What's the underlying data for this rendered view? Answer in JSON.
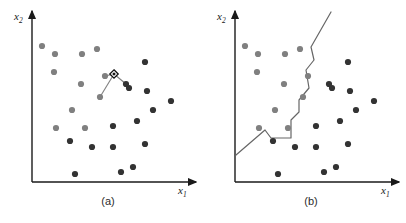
{
  "figure": {
    "width": 406,
    "height": 223,
    "background": "#ffffff",
    "colors": {
      "axis": "#1a1a1a",
      "class_a_point": "#808080",
      "class_b_point": "#333333",
      "boundary_line": "#666666",
      "connector_line": "#808080",
      "query_marker_stroke": "#111111",
      "caption_text": "#2b2b2b"
    }
  },
  "panels": [
    {
      "id": "panel-a",
      "caption": "(a)",
      "caption_pos": {
        "x": 108,
        "y": 205
      },
      "axes": {
        "origin": {
          "x": 32,
          "y": 182
        },
        "x_axis_end": {
          "x": 196,
          "y": 182
        },
        "y_axis_end": {
          "x": 32,
          "y": 11
        },
        "x_label": {
          "base": "x",
          "sub": "1",
          "x": 178,
          "y": 194
        },
        "y_label": {
          "base": "x",
          "sub": "2",
          "x": 14,
          "y": 20
        }
      },
      "points": [
        {
          "x": 42,
          "y": 46,
          "cls": "a"
        },
        {
          "x": 55,
          "y": 54,
          "cls": "a"
        },
        {
          "x": 82,
          "y": 54,
          "cls": "a"
        },
        {
          "x": 97,
          "y": 49,
          "cls": "a"
        },
        {
          "x": 54,
          "y": 72,
          "cls": "a"
        },
        {
          "x": 81,
          "y": 84,
          "cls": "a"
        },
        {
          "x": 72,
          "y": 110,
          "cls": "a"
        },
        {
          "x": 56,
          "y": 128,
          "cls": "a"
        },
        {
          "x": 85,
          "y": 128,
          "cls": "a"
        },
        {
          "x": 105,
          "y": 76,
          "cls": "a"
        },
        {
          "x": 100,
          "y": 97,
          "cls": "a"
        },
        {
          "x": 145,
          "y": 62,
          "cls": "b"
        },
        {
          "x": 129,
          "y": 88,
          "cls": "b"
        },
        {
          "x": 147,
          "y": 91,
          "cls": "b"
        },
        {
          "x": 126,
          "y": 84,
          "cls": "b"
        },
        {
          "x": 171,
          "y": 101,
          "cls": "b"
        },
        {
          "x": 153,
          "y": 110,
          "cls": "b"
        },
        {
          "x": 137,
          "y": 121,
          "cls": "b"
        },
        {
          "x": 113,
          "y": 126,
          "cls": "b"
        },
        {
          "x": 70,
          "y": 141,
          "cls": "b"
        },
        {
          "x": 92,
          "y": 147,
          "cls": "b"
        },
        {
          "x": 113,
          "y": 147,
          "cls": "b"
        },
        {
          "x": 145,
          "y": 144,
          "cls": "b"
        },
        {
          "x": 75,
          "y": 174,
          "cls": "b"
        },
        {
          "x": 121,
          "y": 172,
          "cls": "b"
        },
        {
          "x": 133,
          "y": 167,
          "cls": "b"
        }
      ],
      "query_marker": {
        "x": 114,
        "y": 74,
        "shape": "diamond"
      },
      "connectors": [
        {
          "x1": 114,
          "y1": 74,
          "x2": 105,
          "y2": 76
        },
        {
          "x1": 114,
          "y1": 74,
          "x2": 126,
          "y2": 84
        },
        {
          "x1": 114,
          "y1": 74,
          "x2": 100,
          "y2": 97
        }
      ],
      "boundary": null
    },
    {
      "id": "panel-b",
      "caption": "(b)",
      "caption_pos": {
        "x": 311,
        "y": 205
      },
      "axes": {
        "origin": {
          "x": 235,
          "y": 182
        },
        "x_axis_end": {
          "x": 399,
          "y": 182
        },
        "y_axis_end": {
          "x": 235,
          "y": 11
        },
        "x_label": {
          "base": "x",
          "sub": "1",
          "x": 381,
          "y": 194
        },
        "y_label": {
          "base": "x",
          "sub": "2",
          "x": 217,
          "y": 20
        }
      },
      "points": [
        {
          "x": 245,
          "y": 46,
          "cls": "a"
        },
        {
          "x": 258,
          "y": 54,
          "cls": "a"
        },
        {
          "x": 285,
          "y": 54,
          "cls": "a"
        },
        {
          "x": 300,
          "y": 49,
          "cls": "a"
        },
        {
          "x": 257,
          "y": 72,
          "cls": "a"
        },
        {
          "x": 284,
          "y": 84,
          "cls": "a"
        },
        {
          "x": 275,
          "y": 110,
          "cls": "a"
        },
        {
          "x": 259,
          "y": 128,
          "cls": "a"
        },
        {
          "x": 288,
          "y": 128,
          "cls": "a"
        },
        {
          "x": 308,
          "y": 76,
          "cls": "a"
        },
        {
          "x": 303,
          "y": 97,
          "cls": "a"
        },
        {
          "x": 348,
          "y": 62,
          "cls": "b"
        },
        {
          "x": 332,
          "y": 88,
          "cls": "b"
        },
        {
          "x": 350,
          "y": 91,
          "cls": "b"
        },
        {
          "x": 329,
          "y": 84,
          "cls": "b"
        },
        {
          "x": 374,
          "y": 101,
          "cls": "b"
        },
        {
          "x": 356,
          "y": 110,
          "cls": "b"
        },
        {
          "x": 340,
          "y": 121,
          "cls": "b"
        },
        {
          "x": 316,
          "y": 126,
          "cls": "b"
        },
        {
          "x": 273,
          "y": 141,
          "cls": "b"
        },
        {
          "x": 295,
          "y": 147,
          "cls": "b"
        },
        {
          "x": 316,
          "y": 147,
          "cls": "b"
        },
        {
          "x": 348,
          "y": 144,
          "cls": "b"
        },
        {
          "x": 278,
          "y": 174,
          "cls": "b"
        },
        {
          "x": 324,
          "y": 172,
          "cls": "b"
        },
        {
          "x": 336,
          "y": 167,
          "cls": "b"
        }
      ],
      "query_marker": null,
      "connectors": [],
      "boundary": {
        "label": "decision-boundary",
        "path": "236,155 265,130 271,138 291,138 291,120 299,112 299,100 309,88 306,70 314,60 311,47 331,12"
      }
    }
  ]
}
